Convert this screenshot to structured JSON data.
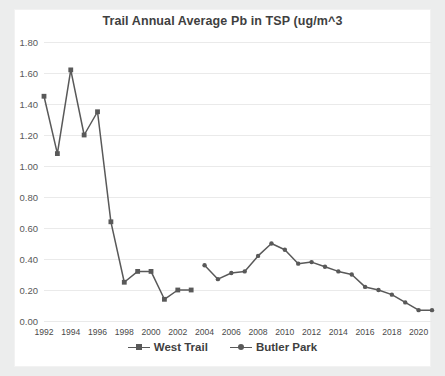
{
  "chart_data": {
    "type": "line",
    "title": "Trail Annual Average Pb in TSP (ug/m^3",
    "xlabel": "",
    "ylabel": "",
    "ylim": [
      0.0,
      1.8
    ],
    "ytick_step": 0.2,
    "yticks": [
      "0.00",
      "0.20",
      "0.40",
      "0.60",
      "0.80",
      "1.00",
      "1.20",
      "1.40",
      "1.60",
      "1.80"
    ],
    "xlim": [
      1992,
      2021
    ],
    "xticks": [
      "1992",
      "1994",
      "1996",
      "1998",
      "2000",
      "2002",
      "2004",
      "2006",
      "2008",
      "2010",
      "2012",
      "2014",
      "2016",
      "2018",
      "2020"
    ],
    "xtick_values": [
      1992,
      1994,
      1996,
      1998,
      2000,
      2002,
      2004,
      2006,
      2008,
      2010,
      2012,
      2014,
      2016,
      2018,
      2020
    ],
    "grid": true,
    "grid_color": "#eaeaea",
    "legend_position": "bottom",
    "line_color": "#595959",
    "series": [
      {
        "name": "West Trail",
        "marker": "square",
        "color": "#595959",
        "x": [
          1992,
          1993,
          1994,
          1995,
          1996,
          1997,
          1998,
          1999,
          2000,
          2001,
          2002,
          2003
        ],
        "values": [
          1.45,
          1.08,
          1.62,
          1.2,
          1.35,
          0.64,
          0.25,
          0.32,
          0.32,
          0.14,
          0.2,
          0.2
        ]
      },
      {
        "name": "Butler Park",
        "marker": "circle",
        "color": "#595959",
        "x": [
          2004,
          2005,
          2006,
          2007,
          2008,
          2009,
          2010,
          2011,
          2012,
          2013,
          2014,
          2015,
          2016,
          2017,
          2018,
          2019,
          2020,
          2021
        ],
        "values": [
          0.36,
          0.27,
          0.31,
          0.32,
          0.42,
          0.5,
          0.46,
          0.37,
          0.38,
          0.35,
          0.32,
          0.3,
          0.22,
          0.2,
          0.17,
          0.12,
          0.07,
          0.07
        ]
      }
    ]
  },
  "legend": {
    "items": [
      {
        "label": "West Trail"
      },
      {
        "label": "Butler Park"
      }
    ]
  }
}
